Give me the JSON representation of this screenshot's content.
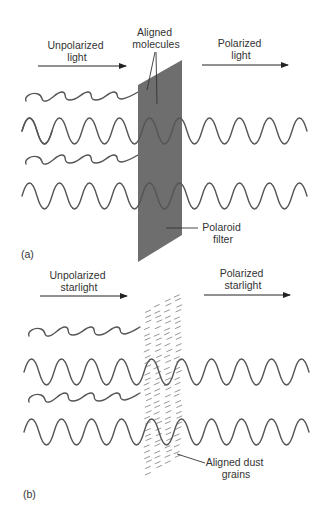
{
  "figure": {
    "panel_a": {
      "panel_label": "(a)",
      "incoming_label": [
        "Unpolarized",
        "light"
      ],
      "outgoing_label": [
        "Polarized",
        "light"
      ],
      "molecules_label": [
        "Aligned",
        "molecules"
      ],
      "filter_label": [
        "Polaroid",
        "filter"
      ],
      "filter_color": "#6e6e6e"
    },
    "panel_b": {
      "panel_label": "(b)",
      "incoming_label": [
        "Unpolarized",
        "starlight"
      ],
      "outgoing_label": [
        "Polarized",
        "starlight"
      ],
      "grains_label": [
        "Aligned dust",
        "grains"
      ],
      "grain_color": "#8a8a8a"
    },
    "colors": {
      "wave": "#555555",
      "text": "#333333",
      "arrow": "#222222",
      "background": "#ffffff"
    }
  }
}
